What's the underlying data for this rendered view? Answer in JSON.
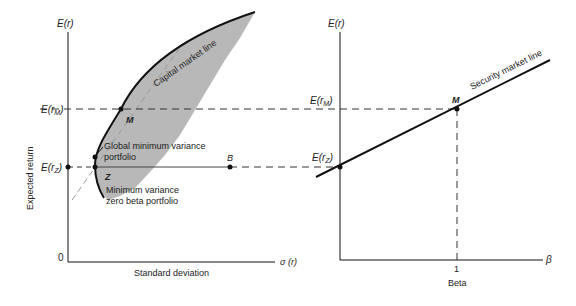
{
  "left_panel": {
    "y_axis_label": "E(r)",
    "y_axis_title": "Expected return",
    "x_axis_label": "σ (r)",
    "x_axis_title": "Standard deviation",
    "origin_label": "0",
    "erm_label_main": "E(r",
    "erm_label_sub": "M",
    "erz_label_main": "E(r",
    "erz_label_sub": "Z",
    "point_M": "M",
    "point_Z": "Z",
    "point_B": "B",
    "frontier_label": "Capital market line",
    "gmv_label_line1": "Global minimum variance",
    "gmv_label_line2": "portfolio",
    "mvzb_label_line1": "Minimum variance",
    "mvzb_label_line2": "zero beta portfolio"
  },
  "right_panel": {
    "y_axis_label": "E(r)",
    "x_axis_label": "β",
    "x_axis_title": "Beta",
    "tick_1": "1",
    "erm_label_main": "E(r",
    "erm_label_sub": "M",
    "erz_label_main": "E(r",
    "erz_label_sub": "Z",
    "point_M": "M",
    "sml_label": "Security market line"
  },
  "colors": {
    "ink": "#111111",
    "shade": "#b8b8b8",
    "dash": "#333333"
  }
}
